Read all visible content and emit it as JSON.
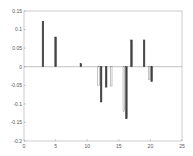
{
  "chart_data": {
    "type": "bar",
    "title": "",
    "xlabel": "",
    "ylabel": "",
    "xlim": [
      0,
      25
    ],
    "ylim": [
      -0.2,
      0.15
    ],
    "grid": false,
    "xticks": [
      0,
      5,
      10,
      15,
      20,
      25
    ],
    "xtick_labels": [
      "0",
      "5",
      "10",
      "15",
      "20",
      "25"
    ],
    "yticks": [
      0.15,
      0.1,
      0.05,
      0,
      -0.05,
      -0.1,
      -0.15,
      -0.2
    ],
    "ytick_labels": [
      "0.15",
      "0.1",
      "0.05",
      "0",
      "-0.05",
      "-0.1",
      "-0.15",
      "-0.2"
    ],
    "series": [
      {
        "name": "series-light",
        "color": "#ffffff",
        "stroke": "#888888",
        "points": [
          {
            "x": 11.8,
            "y": -0.05
          },
          {
            "x": 13.8,
            "y": -0.052
          },
          {
            "x": 15.8,
            "y": -0.12
          },
          {
            "x": 19.8,
            "y": -0.035
          }
        ]
      },
      {
        "name": "series-dark",
        "color": "#444444",
        "stroke": "#333333",
        "points": [
          {
            "x": 3,
            "y": 0.122
          },
          {
            "x": 5,
            "y": 0.08
          },
          {
            "x": 9,
            "y": 0.008
          },
          {
            "x": 12.2,
            "y": -0.095
          },
          {
            "x": 13,
            "y": -0.055
          },
          {
            "x": 16.2,
            "y": -0.14
          },
          {
            "x": 17,
            "y": 0.072
          },
          {
            "x": 19,
            "y": 0.072
          },
          {
            "x": 20.2,
            "y": -0.04
          }
        ]
      }
    ]
  }
}
